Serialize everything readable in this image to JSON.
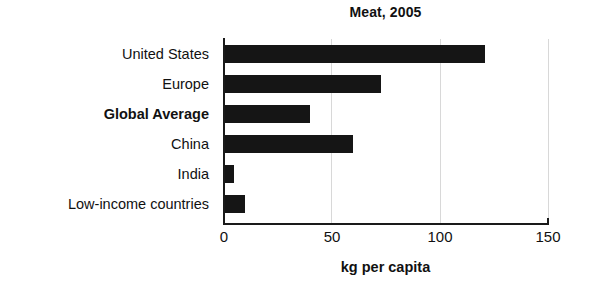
{
  "chart_data": {
    "type": "bar",
    "orientation": "horizontal",
    "title": "Meat, 2005",
    "xlabel": "kg per capita",
    "ylabel": "",
    "categories": [
      "United States",
      "Europe",
      "Global Average",
      "China",
      "India",
      "Low-income countries"
    ],
    "values": [
      121,
      73,
      40,
      60,
      5,
      10
    ],
    "emphasized_categories": [
      "Global Average"
    ],
    "xlim": [
      0,
      150
    ],
    "xticks": [
      0,
      50,
      100,
      150
    ],
    "xtick_labels": [
      "0",
      "50",
      "100",
      "150"
    ],
    "grid": "vertical-faint",
    "legend": "none",
    "bar_color": "#151515",
    "background_color": "#ffffff",
    "axis_color": "#1a1a1a",
    "gridline_color": "#d8d8d8"
  }
}
